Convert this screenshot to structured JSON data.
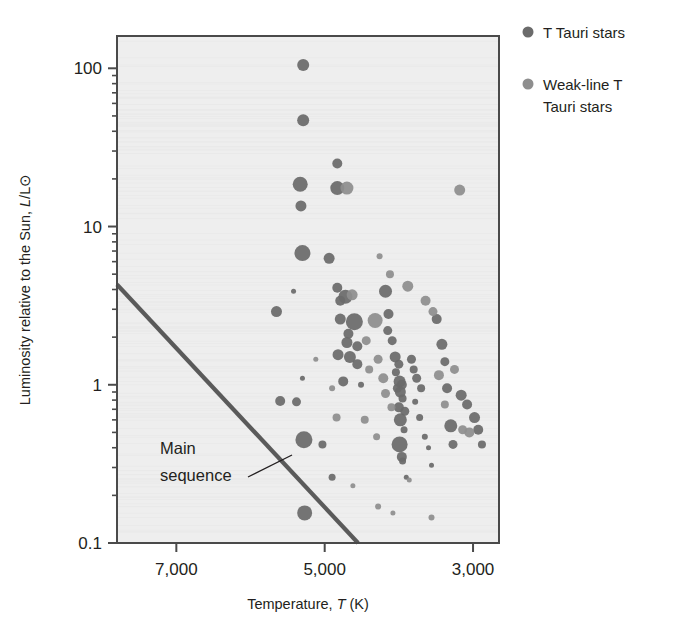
{
  "chart_data": {
    "type": "scatter",
    "title": "",
    "xlabel": "Temperature, T (K)",
    "ylabel": "Luminosity relative to the Sun, L/L⊙",
    "xlabel_parts": {
      "prefix": "Temperature, ",
      "symbol": "T",
      "suffix": " (K)"
    },
    "ylabel_parts": {
      "prefix": "Luminosity relative to the Sun, ",
      "symbol": "L",
      "suffix": "/L⊙"
    },
    "xscale": "linear-reversed",
    "yscale": "log",
    "xlim": [
      7800,
      2650
    ],
    "ylim": [
      0.1,
      160
    ],
    "xticks": [
      7000,
      5000,
      3000
    ],
    "xticklabels": [
      "7,000",
      "5,000",
      "3,000"
    ],
    "yticks": [
      0.1,
      1,
      10,
      100
    ],
    "yticklabels": [
      "0.1",
      "1",
      "10",
      "100"
    ],
    "yminorticks": [
      0.2,
      0.3,
      0.4,
      0.5,
      0.6,
      0.7,
      0.8,
      0.9,
      2,
      3,
      4,
      5,
      6,
      7,
      8,
      9,
      20,
      30,
      40,
      50,
      60,
      70,
      80,
      90
    ],
    "grid": false,
    "legend_position": "outside-top-right",
    "colors": {
      "t_tauri": "#6b6b6b",
      "weak_line": "#8e8e8e",
      "main_sequence_line": "#5a5a5a",
      "plot_background": "#eeeeee",
      "frame": "#4a4a4a",
      "text": "#231f20"
    },
    "annotations": [
      {
        "name": "main-sequence",
        "text_line1": "Main",
        "text_line2": "sequence",
        "x": 6400,
        "y": 0.26
      }
    ],
    "main_sequence_line": {
      "x_start": 7800,
      "y_start": 4.3,
      "x_end": 4550,
      "y_end": 0.1
    },
    "legend": [
      {
        "label": "T Tauri stars",
        "series": "t_tauri",
        "color": "#6b6b6b"
      },
      {
        "label": "Weak-line T Tauri stars",
        "line1": "Weak-line T",
        "line2": "Tauri stars",
        "series": "weak_line",
        "color": "#8e8e8e"
      }
    ],
    "series": [
      {
        "name": "T Tauri stars",
        "color": "#6b6b6b",
        "points": [
          {
            "x": 5290,
            "y": 105,
            "r": 6.0
          },
          {
            "x": 5290,
            "y": 47,
            "r": 6.0
          },
          {
            "x": 4830,
            "y": 25,
            "r": 5.0
          },
          {
            "x": 5330,
            "y": 18.5,
            "r": 7.5
          },
          {
            "x": 4830,
            "y": 17.5,
            "r": 7.0
          },
          {
            "x": 5320,
            "y": 13.5,
            "r": 5.5
          },
          {
            "x": 5300,
            "y": 6.8,
            "r": 8.0
          },
          {
            "x": 4940,
            "y": 6.3,
            "r": 5.5
          },
          {
            "x": 4830,
            "y": 4.1,
            "r": 5.0
          },
          {
            "x": 4720,
            "y": 3.6,
            "r": 7.0
          },
          {
            "x": 4790,
            "y": 3.4,
            "r": 5.0
          },
          {
            "x": 4180,
            "y": 3.9,
            "r": 6.5
          },
          {
            "x": 5420,
            "y": 3.9,
            "r": 2.5
          },
          {
            "x": 5650,
            "y": 2.9,
            "r": 5.5
          },
          {
            "x": 4790,
            "y": 2.6,
            "r": 5.5
          },
          {
            "x": 4600,
            "y": 2.5,
            "r": 8.5
          },
          {
            "x": 4680,
            "y": 2.1,
            "r": 5.0
          },
          {
            "x": 4700,
            "y": 1.85,
            "r": 5.5
          },
          {
            "x": 4560,
            "y": 1.75,
            "r": 5.0
          },
          {
            "x": 4820,
            "y": 1.55,
            "r": 5.5
          },
          {
            "x": 4660,
            "y": 1.5,
            "r": 6.0
          },
          {
            "x": 4560,
            "y": 1.35,
            "r": 5.0
          },
          {
            "x": 5300,
            "y": 1.1,
            "r": 2.5
          },
          {
            "x": 4750,
            "y": 1.05,
            "r": 5.0
          },
          {
            "x": 4510,
            "y": 1.0,
            "r": 3.0
          },
          {
            "x": 4140,
            "y": 2.8,
            "r": 5.0
          },
          {
            "x": 4150,
            "y": 2.2,
            "r": 4.5
          },
          {
            "x": 4090,
            "y": 1.9,
            "r": 4.5
          },
          {
            "x": 4050,
            "y": 1.5,
            "r": 5.5
          },
          {
            "x": 4000,
            "y": 1.35,
            "r": 4.5
          },
          {
            "x": 4040,
            "y": 1.2,
            "r": 4.0
          },
          {
            "x": 3990,
            "y": 1.05,
            "r": 6.0
          },
          {
            "x": 3960,
            "y": 1.0,
            "r": 5.0
          },
          {
            "x": 4020,
            "y": 0.95,
            "r": 4.5
          },
          {
            "x": 3980,
            "y": 0.9,
            "r": 5.5
          },
          {
            "x": 3950,
            "y": 0.82,
            "r": 4.0
          },
          {
            "x": 4000,
            "y": 0.72,
            "r": 5.0
          },
          {
            "x": 3920,
            "y": 0.68,
            "r": 4.5
          },
          {
            "x": 3980,
            "y": 0.6,
            "r": 6.5
          },
          {
            "x": 3930,
            "y": 0.52,
            "r": 3.5
          },
          {
            "x": 3990,
            "y": 0.42,
            "r": 8.0
          },
          {
            "x": 3960,
            "y": 0.35,
            "r": 5.0
          },
          {
            "x": 3950,
            "y": 0.33,
            "r": 3.5
          },
          {
            "x": 3900,
            "y": 0.26,
            "r": 2.5
          },
          {
            "x": 3830,
            "y": 1.45,
            "r": 4.5
          },
          {
            "x": 3800,
            "y": 1.25,
            "r": 4.0
          },
          {
            "x": 3760,
            "y": 1.1,
            "r": 4.5
          },
          {
            "x": 3700,
            "y": 0.95,
            "r": 4.0
          },
          {
            "x": 3780,
            "y": 0.78,
            "r": 3.0
          },
          {
            "x": 3720,
            "y": 0.62,
            "r": 3.5
          },
          {
            "x": 3650,
            "y": 0.47,
            "r": 3.0
          },
          {
            "x": 3600,
            "y": 0.4,
            "r": 2.5
          },
          {
            "x": 3560,
            "y": 0.31,
            "r": 2.5
          },
          {
            "x": 3490,
            "y": 2.6,
            "r": 5.0
          },
          {
            "x": 3420,
            "y": 1.8,
            "r": 5.5
          },
          {
            "x": 3380,
            "y": 1.4,
            "r": 4.5
          },
          {
            "x": 3350,
            "y": 0.95,
            "r": 5.0
          },
          {
            "x": 3300,
            "y": 0.55,
            "r": 6.5
          },
          {
            "x": 3270,
            "y": 0.42,
            "r": 4.5
          },
          {
            "x": 3160,
            "y": 0.86,
            "r": 5.5
          },
          {
            "x": 3080,
            "y": 0.75,
            "r": 5.0
          },
          {
            "x": 2980,
            "y": 0.62,
            "r": 5.5
          },
          {
            "x": 2930,
            "y": 0.52,
            "r": 5.0
          },
          {
            "x": 2880,
            "y": 0.42,
            "r": 4.0
          },
          {
            "x": 5280,
            "y": 0.45,
            "r": 8.5
          },
          {
            "x": 5270,
            "y": 0.155,
            "r": 7.5
          },
          {
            "x": 5030,
            "y": 0.42,
            "r": 4.0
          },
          {
            "x": 4900,
            "y": 0.26,
            "r": 3.5
          },
          {
            "x": 5380,
            "y": 0.78,
            "r": 4.5
          },
          {
            "x": 5600,
            "y": 0.79,
            "r": 5.0
          }
        ]
      },
      {
        "name": "Weak-line T Tauri stars",
        "color": "#8e8e8e",
        "points": [
          {
            "x": 4700,
            "y": 17.5,
            "r": 6.5
          },
          {
            "x": 4630,
            "y": 3.7,
            "r": 5.5
          },
          {
            "x": 4320,
            "y": 2.55,
            "r": 7.5
          },
          {
            "x": 4440,
            "y": 1.9,
            "r": 4.5
          },
          {
            "x": 4400,
            "y": 1.25,
            "r": 4.0
          },
          {
            "x": 4280,
            "y": 1.45,
            "r": 4.5
          },
          {
            "x": 4210,
            "y": 1.1,
            "r": 5.0
          },
          {
            "x": 4180,
            "y": 0.88,
            "r": 4.5
          },
          {
            "x": 4100,
            "y": 0.72,
            "r": 4.0
          },
          {
            "x": 3880,
            "y": 4.2,
            "r": 5.5
          },
          {
            "x": 3640,
            "y": 3.4,
            "r": 5.0
          },
          {
            "x": 3540,
            "y": 2.9,
            "r": 4.5
          },
          {
            "x": 3460,
            "y": 1.15,
            "r": 5.0
          },
          {
            "x": 3380,
            "y": 0.75,
            "r": 4.0
          },
          {
            "x": 3250,
            "y": 1.25,
            "r": 4.5
          },
          {
            "x": 3180,
            "y": 17.0,
            "r": 5.5
          },
          {
            "x": 3140,
            "y": 0.52,
            "r": 4.5
          },
          {
            "x": 3050,
            "y": 0.5,
            "r": 5.0
          },
          {
            "x": 4840,
            "y": 0.62,
            "r": 4.0
          },
          {
            "x": 4460,
            "y": 0.6,
            "r": 4.0
          },
          {
            "x": 4300,
            "y": 0.47,
            "r": 3.5
          },
          {
            "x": 4620,
            "y": 0.23,
            "r": 2.5
          },
          {
            "x": 4280,
            "y": 0.17,
            "r": 3.0
          },
          {
            "x": 4080,
            "y": 0.155,
            "r": 2.5
          },
          {
            "x": 3860,
            "y": 0.25,
            "r": 2.5
          },
          {
            "x": 3560,
            "y": 0.145,
            "r": 3.0
          },
          {
            "x": 5120,
            "y": 1.45,
            "r": 2.5
          },
          {
            "x": 4900,
            "y": 0.95,
            "r": 3.0
          },
          {
            "x": 4260,
            "y": 6.5,
            "r": 3.0
          },
          {
            "x": 4120,
            "y": 5.0,
            "r": 4.0
          }
        ]
      }
    ]
  }
}
